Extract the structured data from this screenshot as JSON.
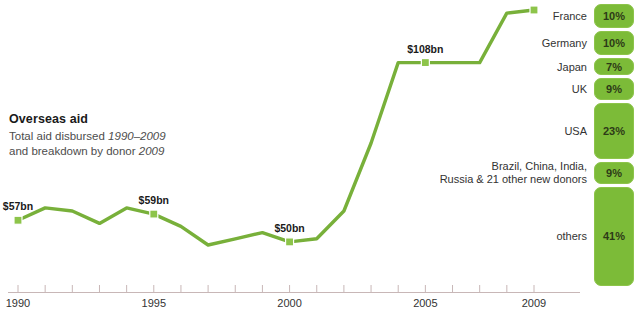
{
  "title": "Overseas aid",
  "subtitle_line1_plain": "Total aid disbursed ",
  "subtitle_line1_em": "1990–2009",
  "subtitle_line2_plain": "and breakdown by donor ",
  "subtitle_line2_em": "2009",
  "colors": {
    "line": "#78b03a",
    "line_light": "#9bc85e",
    "bar_fill": "#7cbb38",
    "bar_edge": "#8dc44a",
    "axis": "#c8b7b7",
    "text": "#333333",
    "title": "#1a1a1a"
  },
  "chart_data": {
    "type": "line",
    "title": "Overseas aid",
    "subtitle": "Total aid disbursed 1990–2009 and breakdown by donor 2009",
    "xlabel": "",
    "ylabel": "Total aid disbursed (US$bn)",
    "xlim": [
      1990,
      2009
    ],
    "ylim": [
      0,
      130
    ],
    "grid": false,
    "legend": "none",
    "xtick_labels": [
      "1990",
      "1995",
      "2000",
      "2005",
      "2009"
    ],
    "xticks_all": [
      1990,
      1991,
      1992,
      1993,
      1994,
      1995,
      1996,
      1997,
      1998,
      1999,
      2000,
      2001,
      2002,
      2003,
      2004,
      2005,
      2006,
      2007,
      2008,
      2009
    ],
    "x": [
      1990,
      1991,
      1992,
      1993,
      1994,
      1995,
      1996,
      1997,
      1998,
      1999,
      2000,
      2001,
      2002,
      2003,
      2004,
      2005,
      2006,
      2007,
      2008,
      2009
    ],
    "values": [
      57,
      61,
      60,
      56,
      61,
      59,
      55,
      49,
      51,
      53,
      50,
      51,
      60,
      82,
      108,
      108,
      108,
      108,
      124,
      125
    ],
    "point_labels": [
      {
        "x": 1990,
        "value": 57,
        "text": "$57bn"
      },
      {
        "x": 1995,
        "value": 59,
        "text": "$59bn"
      },
      {
        "x": 2000,
        "value": 50,
        "text": "$50bn"
      },
      {
        "x": 2005,
        "value": 108,
        "text": "$108bn"
      }
    ],
    "markers_at": [
      1990,
      1995,
      2000,
      2005,
      2009
    ]
  },
  "breakdown": {
    "type": "stacked-bar",
    "title": "breakdown by donor 2009",
    "unit": "%",
    "items": [
      {
        "label": "France",
        "value": 10,
        "pct_text": "10%"
      },
      {
        "label": "Germany",
        "value": 10,
        "pct_text": "10%"
      },
      {
        "label": "Japan",
        "value": 7,
        "pct_text": "7%"
      },
      {
        "label": "UK",
        "value": 9,
        "pct_text": "9%"
      },
      {
        "label": "USA",
        "value": 23,
        "pct_text": "23%"
      },
      {
        "label": "Brazil, China, India,\nRussia & 21 other new donors",
        "value": 9,
        "pct_text": "9%"
      },
      {
        "label": "others",
        "value": 41,
        "pct_text": "41%"
      }
    ]
  }
}
